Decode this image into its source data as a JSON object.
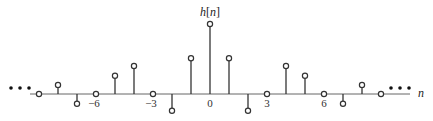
{
  "chart_data": {
    "type": "stem",
    "title": "h[n]",
    "xlabel": "n",
    "ylabel": "h[n]",
    "x_tick_labels": [
      "-6",
      "-3",
      "0",
      "3",
      "6"
    ],
    "x_ticks": [
      -6,
      -3,
      0,
      3,
      6
    ],
    "continues_both_directions": true,
    "ellipsis": "• • •",
    "x": [
      -9,
      -8,
      -7,
      -6,
      -5,
      -4,
      -3,
      -2,
      -1,
      0,
      1,
      2,
      3,
      4,
      5,
      6,
      7,
      8,
      9
    ],
    "values": [
      0,
      0.13,
      -0.14,
      0,
      0.26,
      0.4,
      0,
      -0.24,
      0.51,
      1.0,
      0.51,
      -0.24,
      0,
      0.4,
      0.26,
      0,
      -0.14,
      0.13,
      0
    ],
    "grid": false,
    "legend": null
  },
  "labels": {
    "title_main": "h",
    "title_arg": "[n]",
    "title_n": "n",
    "axis_n": "n",
    "tick_m6": "−6",
    "tick_m3": "−3",
    "tick_0": "0",
    "tick_3": "3",
    "tick_6": "6"
  },
  "colors": {
    "axis": "#555555",
    "stem": "#333333",
    "marker_fill": "#ffffff",
    "marker_stroke": "#333333"
  }
}
